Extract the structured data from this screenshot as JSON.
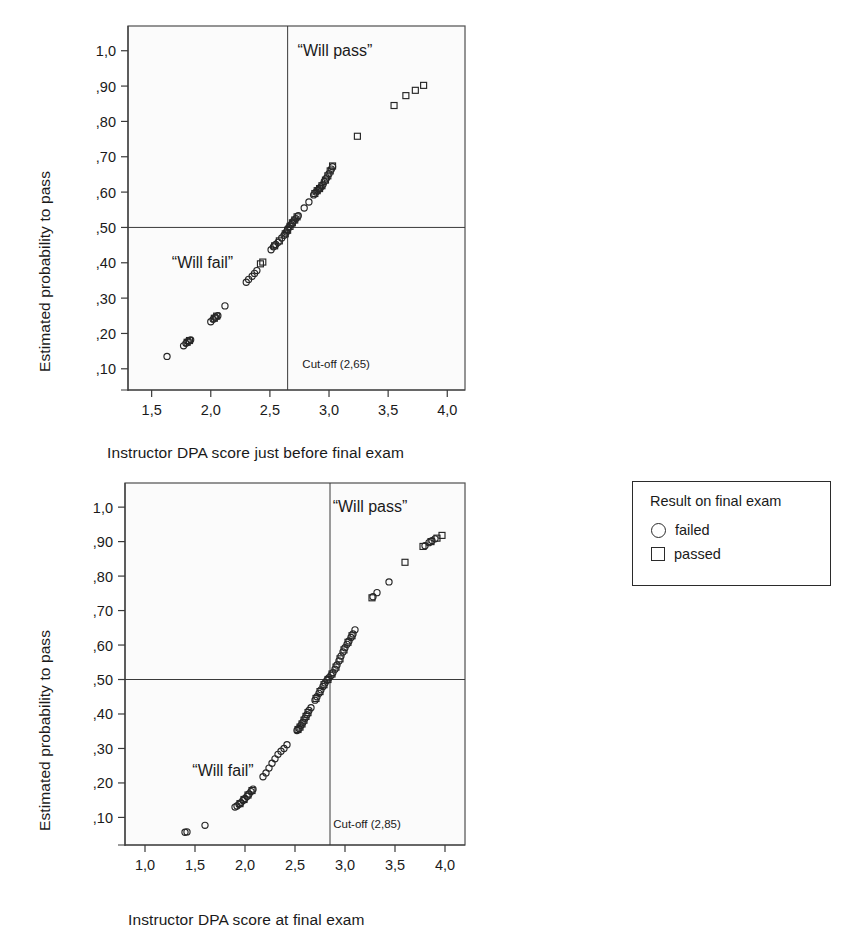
{
  "figure": {
    "y_axis_label": "Estimated probability to pass"
  },
  "legend": {
    "title": "Result on final exam",
    "items": [
      {
        "marker": "circle-outline-icon",
        "label": "failed"
      },
      {
        "marker": "square-outline-icon",
        "label": "passed"
      }
    ]
  },
  "charts": [
    {
      "id": "top",
      "xlabel": "Instructor DPA score just before final exam",
      "ylabel": "Estimated probability to pass",
      "cutoff_label": "Cut-off (2,65)",
      "region_pass_label": "“Will pass”",
      "region_fail_label": "“Will fail”",
      "x_ticks": [
        "1,5",
        "2,0",
        "2,5",
        "3,0",
        "3,5",
        "4,0"
      ],
      "y_ticks": [
        "1,0",
        ",90",
        ",80",
        ",70",
        ",60",
        ",50",
        ",40",
        ",30",
        ",20",
        ",10"
      ]
    },
    {
      "id": "bottom",
      "xlabel": "Instructor DPA score at final exam",
      "ylabel": "Estimated probability to pass",
      "cutoff_label": "Cut-off (2,85)",
      "region_pass_label": "“Will pass”",
      "region_fail_label": "“Will fail”",
      "x_ticks": [
        "1,0",
        "1,5",
        "2,0",
        "2,5",
        "3,0",
        "3,5",
        "4,0"
      ],
      "y_ticks": [
        "1,0",
        ",90",
        ",80",
        ",70",
        ",60",
        ",50",
        ",40",
        ",30",
        ",20",
        ",10"
      ]
    }
  ],
  "chart_data": [
    {
      "type": "scatter",
      "id": "top",
      "title": "",
      "xlabel": "Instructor DPA score just before final exam",
      "ylabel": "Estimated probability to pass",
      "xlim": [
        1.3,
        4.15
      ],
      "ylim": [
        0.04,
        1.07
      ],
      "x_ticks": [
        1.5,
        2.0,
        2.5,
        3.0,
        3.5,
        4.0
      ],
      "y_ticks": [
        1.0,
        0.9,
        0.8,
        0.7,
        0.6,
        0.5,
        0.4,
        0.3,
        0.2,
        0.1
      ],
      "grid": false,
      "legend_position": "outside-right",
      "reference_lines": [
        {
          "orientation": "horizontal",
          "value": 0.5,
          "label": ""
        },
        {
          "orientation": "vertical",
          "value": 2.65,
          "label": "Cut-off (2,65)"
        }
      ],
      "annotations": [
        {
          "text": "“Will pass”",
          "x": 3.05,
          "y": 1.0
        },
        {
          "text": "“Will fail”",
          "x": 1.93,
          "y": 0.4
        },
        {
          "text": "Cut-off (2,65)",
          "x": 3.06,
          "y": 0.115
        }
      ],
      "series": [
        {
          "name": "failed",
          "marker": "circle",
          "points": [
            [
              1.63,
              0.135
            ],
            [
              1.77,
              0.165
            ],
            [
              1.79,
              0.172
            ],
            [
              1.81,
              0.178
            ],
            [
              1.83,
              0.182
            ],
            [
              2.0,
              0.233
            ],
            [
              2.02,
              0.24
            ],
            [
              2.04,
              0.246
            ],
            [
              2.06,
              0.25
            ],
            [
              2.12,
              0.278
            ],
            [
              2.3,
              0.345
            ],
            [
              2.32,
              0.353
            ],
            [
              2.35,
              0.362
            ],
            [
              2.37,
              0.37
            ],
            [
              2.39,
              0.378
            ],
            [
              2.51,
              0.437
            ],
            [
              2.53,
              0.445
            ],
            [
              2.55,
              0.452
            ],
            [
              2.57,
              0.458
            ],
            [
              2.6,
              0.47
            ],
            [
              2.62,
              0.478
            ],
            [
              2.64,
              0.487
            ],
            [
              2.65,
              0.495
            ],
            [
              2.66,
              0.5
            ],
            [
              2.68,
              0.508
            ],
            [
              2.69,
              0.512
            ],
            [
              2.7,
              0.518
            ],
            [
              2.72,
              0.525
            ],
            [
              2.74,
              0.533
            ],
            [
              2.79,
              0.555
            ],
            [
              2.83,
              0.572
            ],
            [
              2.87,
              0.592
            ],
            [
              2.89,
              0.6
            ],
            [
              2.91,
              0.607
            ],
            [
              2.93,
              0.614
            ],
            [
              2.95,
              0.622
            ],
            [
              2.96,
              0.63
            ],
            [
              2.98,
              0.64
            ],
            [
              3.0,
              0.652
            ],
            [
              3.02,
              0.665
            ],
            [
              3.03,
              0.672
            ]
          ]
        },
        {
          "name": "passed",
          "marker": "square",
          "points": [
            [
              1.8,
              0.175
            ],
            [
              1.82,
              0.18
            ],
            [
              2.03,
              0.243
            ],
            [
              2.05,
              0.249
            ],
            [
              2.42,
              0.397
            ],
            [
              2.44,
              0.402
            ],
            [
              2.54,
              0.448
            ],
            [
              2.58,
              0.462
            ],
            [
              2.63,
              0.482
            ],
            [
              2.65,
              0.492
            ],
            [
              2.67,
              0.503
            ],
            [
              2.69,
              0.513
            ],
            [
              2.71,
              0.521
            ],
            [
              2.73,
              0.53
            ],
            [
              2.88,
              0.596
            ],
            [
              2.9,
              0.604
            ],
            [
              2.92,
              0.61
            ],
            [
              2.94,
              0.618
            ],
            [
              2.97,
              0.634
            ],
            [
              2.99,
              0.646
            ],
            [
              3.01,
              0.66
            ],
            [
              3.03,
              0.674
            ],
            [
              3.24,
              0.758
            ],
            [
              3.55,
              0.845
            ],
            [
              3.65,
              0.873
            ],
            [
              3.73,
              0.888
            ],
            [
              3.8,
              0.902
            ]
          ]
        }
      ]
    },
    {
      "type": "scatter",
      "id": "bottom",
      "title": "",
      "xlabel": "Instructor DPA score at final exam",
      "ylabel": "Estimated probability to pass",
      "xlim": [
        0.8,
        4.2
      ],
      "ylim": [
        0.02,
        1.07
      ],
      "x_ticks": [
        1.0,
        1.5,
        2.0,
        2.5,
        3.0,
        3.5,
        4.0
      ],
      "y_ticks": [
        1.0,
        0.9,
        0.8,
        0.7,
        0.6,
        0.5,
        0.4,
        0.3,
        0.2,
        0.1
      ],
      "grid": false,
      "legend_position": "outside-right",
      "reference_lines": [
        {
          "orientation": "horizontal",
          "value": 0.5,
          "label": ""
        },
        {
          "orientation": "vertical",
          "value": 2.85,
          "label": "Cut-off (2,85)"
        }
      ],
      "annotations": [
        {
          "text": "“Will pass”",
          "x": 3.25,
          "y": 1.0
        },
        {
          "text": "“Will fail”",
          "x": 1.78,
          "y": 0.235
        },
        {
          "text": "Cut-off (2,85)",
          "x": 3.22,
          "y": 0.085
        }
      ],
      "series": [
        {
          "name": "failed",
          "marker": "circle",
          "points": [
            [
              1.4,
              0.057
            ],
            [
              1.42,
              0.058
            ],
            [
              1.6,
              0.077
            ],
            [
              1.9,
              0.13
            ],
            [
              1.92,
              0.133
            ],
            [
              1.94,
              0.138
            ],
            [
              1.96,
              0.143
            ],
            [
              1.98,
              0.149
            ],
            [
              2.0,
              0.155
            ],
            [
              2.02,
              0.161
            ],
            [
              2.04,
              0.168
            ],
            [
              2.06,
              0.175
            ],
            [
              2.08,
              0.182
            ],
            [
              2.18,
              0.218
            ],
            [
              2.21,
              0.229
            ],
            [
              2.24,
              0.243
            ],
            [
              2.27,
              0.257
            ],
            [
              2.3,
              0.27
            ],
            [
              2.33,
              0.283
            ],
            [
              2.36,
              0.292
            ],
            [
              2.39,
              0.3
            ],
            [
              2.42,
              0.311
            ],
            [
              2.52,
              0.352
            ],
            [
              2.54,
              0.358
            ],
            [
              2.56,
              0.367
            ],
            [
              2.58,
              0.376
            ],
            [
              2.6,
              0.388
            ],
            [
              2.62,
              0.398
            ],
            [
              2.64,
              0.41
            ],
            [
              2.66,
              0.418
            ],
            [
              2.7,
              0.44
            ],
            [
              2.72,
              0.45
            ],
            [
              2.74,
              0.46
            ],
            [
              2.76,
              0.47
            ],
            [
              2.78,
              0.48
            ],
            [
              2.8,
              0.49
            ],
            [
              2.82,
              0.498
            ],
            [
              2.84,
              0.505
            ],
            [
              2.86,
              0.512
            ],
            [
              2.88,
              0.52
            ],
            [
              2.9,
              0.53
            ],
            [
              2.92,
              0.542
            ],
            [
              2.94,
              0.554
            ],
            [
              2.96,
              0.568
            ],
            [
              2.98,
              0.58
            ],
            [
              3.0,
              0.592
            ],
            [
              3.02,
              0.602
            ],
            [
              3.04,
              0.612
            ],
            [
              3.06,
              0.622
            ],
            [
              3.08,
              0.632
            ],
            [
              3.1,
              0.644
            ],
            [
              3.28,
              0.74
            ],
            [
              3.32,
              0.752
            ],
            [
              3.44,
              0.783
            ],
            [
              3.8,
              0.888
            ],
            [
              3.84,
              0.897
            ],
            [
              3.87,
              0.903
            ],
            [
              3.9,
              0.908
            ]
          ]
        },
        {
          "name": "passed",
          "marker": "square",
          "points": [
            [
              1.95,
              0.14
            ],
            [
              1.99,
              0.152
            ],
            [
              2.03,
              0.165
            ],
            [
              2.07,
              0.178
            ],
            [
              2.53,
              0.355
            ],
            [
              2.55,
              0.362
            ],
            [
              2.57,
              0.371
            ],
            [
              2.59,
              0.382
            ],
            [
              2.61,
              0.393
            ],
            [
              2.63,
              0.404
            ],
            [
              2.71,
              0.445
            ],
            [
              2.75,
              0.465
            ],
            [
              2.79,
              0.485
            ],
            [
              2.83,
              0.5
            ],
            [
              2.87,
              0.516
            ],
            [
              2.91,
              0.536
            ],
            [
              2.95,
              0.56
            ],
            [
              2.99,
              0.586
            ],
            [
              3.03,
              0.608
            ],
            [
              3.07,
              0.627
            ],
            [
              3.27,
              0.737
            ],
            [
              3.6,
              0.84
            ],
            [
              3.78,
              0.886
            ],
            [
              3.86,
              0.9
            ],
            [
              3.92,
              0.91
            ],
            [
              3.97,
              0.918
            ]
          ]
        }
      ]
    }
  ]
}
